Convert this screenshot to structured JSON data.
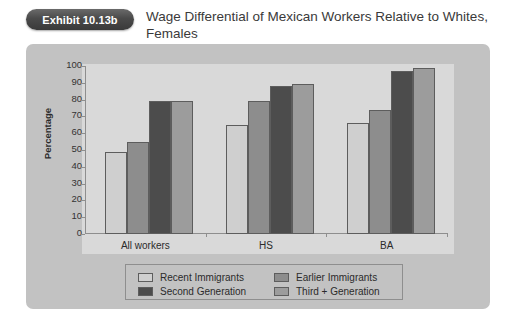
{
  "header": {
    "exhibit_badge": "Exhibit 10.13b",
    "title": "Wage Differential of Mexican Workers Relative to Whites, Females"
  },
  "chart_data": {
    "type": "bar",
    "title": "Wage Differential of Mexican Workers Relative to Whites, Females",
    "xlabel": "",
    "ylabel": "Percentage",
    "ylim": [
      0,
      100
    ],
    "yticks": [
      0,
      10,
      20,
      30,
      40,
      50,
      60,
      70,
      80,
      90,
      100
    ],
    "grid": false,
    "legend_position": "bottom",
    "categories": [
      "All workers",
      "HS",
      "BA"
    ],
    "series": [
      {
        "name": "Recent Immigrants",
        "color": "#cfcfcf",
        "values": [
          49,
          65,
          66
        ]
      },
      {
        "name": "Earlier Immigrants",
        "color": "#8d8d8d",
        "values": [
          55,
          79,
          74
        ]
      },
      {
        "name": "Second Generation",
        "color": "#4c4c4c",
        "values": [
          79,
          88,
          97
        ]
      },
      {
        "name": "Third + Generation",
        "color": "#9c9c9c",
        "values": [
          79,
          89,
          99
        ]
      }
    ]
  },
  "colors": {
    "panel_background": "#c2c2c2",
    "plot_background": "#d9d9d9",
    "axis": "#8e8e8e",
    "bar_outline": "#5d5d5d",
    "badge": "#4a4a4a",
    "text": "#2b2b2b"
  }
}
